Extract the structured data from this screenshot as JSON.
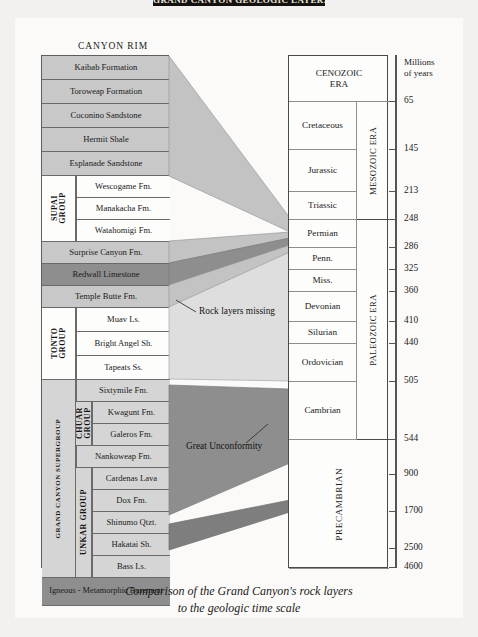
{
  "banner": {
    "text": "GRAND CANYON GEOLOGIC LAYERS"
  },
  "labels": {
    "canyon_rim": "CANYON RIM",
    "rock_layers_missing": "Rock layers missing",
    "great_unconformity": "Great Unconformity",
    "axis_title_line1": "Millions",
    "axis_title_line2": "of years"
  },
  "caption": {
    "line1": "Comparison of the Grand Canyon's rock layers",
    "line2": "to the geologic time scale"
  },
  "colors": {
    "page_background": "#f2f1ef",
    "card_background": "#fbfaf8",
    "strata_medium": "#c8c8c8",
    "strata_dark": "#8e8e8e",
    "strata_white": "#fdfdfc",
    "strata_light": "#d5d5d5",
    "banner": "#15120f",
    "border": "#5e5e5e"
  },
  "strata": {
    "rows": [
      {
        "label": "Kaibab Formation",
        "tone": "g-med",
        "top": 0,
        "height": 24,
        "indent": 0
      },
      {
        "label": "Toroweap Formation",
        "tone": "g-med",
        "top": 24,
        "height": 24,
        "indent": 0
      },
      {
        "label": "Coconino Sandstone",
        "tone": "g-med",
        "top": 48,
        "height": 24,
        "indent": 0
      },
      {
        "label": "Hermit Shale",
        "tone": "g-med",
        "top": 72,
        "height": 24,
        "indent": 0
      },
      {
        "label": "Esplanade Sandstone",
        "tone": "g-med",
        "top": 96,
        "height": 24,
        "indent": 0
      },
      {
        "label": "Wescogame Fm.",
        "tone": "g-white",
        "top": 120,
        "height": 22,
        "indent": 1
      },
      {
        "label": "Manakacha Fm.",
        "tone": "g-white",
        "top": 142,
        "height": 22,
        "indent": 1
      },
      {
        "label": "Watahomigi Fm.",
        "tone": "g-white",
        "top": 164,
        "height": 22,
        "indent": 1
      },
      {
        "label": "Surprise Canyon Fm.",
        "tone": "g-med",
        "top": 186,
        "height": 22,
        "indent": 0
      },
      {
        "label": "Redwall Limestone",
        "tone": "g-dark",
        "top": 208,
        "height": 22,
        "indent": 0
      },
      {
        "label": "Temple Butte Fm.",
        "tone": "g-med",
        "top": 230,
        "height": 22,
        "indent": 0
      },
      {
        "label": "Muav Ls.",
        "tone": "g-white",
        "top": 252,
        "height": 24,
        "indent": 1
      },
      {
        "label": "Bright Angel Sh.",
        "tone": "g-white",
        "top": 276,
        "height": 24,
        "indent": 1
      },
      {
        "label": "Tapeats Ss.",
        "tone": "g-white",
        "top": 300,
        "height": 24,
        "indent": 1
      },
      {
        "label": "Sixtymile Fm.",
        "tone": "g-light",
        "top": 324,
        "height": 22,
        "indent": 1
      },
      {
        "label": "Kwagunt Fm.",
        "tone": "g-light",
        "top": 346,
        "height": 22,
        "indent": 2
      },
      {
        "label": "Galeros Fm.",
        "tone": "g-light",
        "top": 368,
        "height": 22,
        "indent": 2
      },
      {
        "label": "Nankoweap Fm.",
        "tone": "g-light",
        "top": 390,
        "height": 22,
        "indent": 1
      },
      {
        "label": "Cardenas Lava",
        "tone": "g-light",
        "top": 412,
        "height": 22,
        "indent": 2
      },
      {
        "label": "Dox Fm.",
        "tone": "g-light",
        "top": 434,
        "height": 22,
        "indent": 2
      },
      {
        "label": "Shinumo Qtzt.",
        "tone": "g-light",
        "top": 456,
        "height": 22,
        "indent": 2
      },
      {
        "label": "Hakatai Sh.",
        "tone": "g-light",
        "top": 478,
        "height": 22,
        "indent": 2
      },
      {
        "label": "Bass Ls.",
        "tone": "g-light",
        "top": 500,
        "height": 22,
        "indent": 2
      },
      {
        "label": "Igneous - Metamorphic Basement",
        "tone": "g-dark",
        "top": 522,
        "height": 28,
        "indent": 0
      }
    ],
    "groups": [
      {
        "name": "SUPAI GROUP",
        "line1": "SUPAI",
        "line2": "GROUP",
        "top": 120,
        "height": 66,
        "left": 0,
        "width": 34,
        "tone": "g-white",
        "rotated_two_line": true
      },
      {
        "name": "TONTO GROUP",
        "line1": "TONTO",
        "line2": "GROUP",
        "top": 252,
        "height": 72,
        "left": 0,
        "width": 34,
        "tone": "g-white",
        "rotated_two_line": true
      },
      {
        "name": "CHUAR GROUP",
        "line1": "CHUAR",
        "line2": "GROUP",
        "top": 346,
        "height": 44,
        "left": 34,
        "width": 16,
        "tone": "g-light",
        "rotated_two_line": true
      },
      {
        "name": "UNKAR GROUP",
        "line1": "UNKAR GROUP",
        "line2": "",
        "top": 412,
        "height": 110,
        "left": 34,
        "width": 16,
        "tone": "g-light",
        "rotated_two_line": false
      },
      {
        "name": "GRAND CANYON SUPERGROUP",
        "line1": "GRAND CANYON SUPERGROUP",
        "line2": "",
        "top": 324,
        "height": 198,
        "left": 0,
        "width": 34,
        "tone": "g-light",
        "rotated_two_line": false
      }
    ]
  },
  "timescale": {
    "rows": [
      {
        "label": "CENOZOIC ERA",
        "top": 0,
        "height": 46,
        "two_line": true,
        "full_width": true,
        "era": ""
      },
      {
        "label": "Cretaceous",
        "top": 46,
        "height": 48,
        "two_line": false,
        "full_width": false,
        "era": "MESOZOIC ERA"
      },
      {
        "label": "Jurassic",
        "top": 94,
        "height": 42,
        "two_line": false,
        "full_width": false,
        "era": ""
      },
      {
        "label": "Triassic",
        "top": 136,
        "height": 28,
        "two_line": false,
        "full_width": false,
        "era": ""
      },
      {
        "label": "Permian",
        "top": 164,
        "height": 28,
        "two_line": false,
        "full_width": false,
        "era": "PALEOZOIC ERA"
      },
      {
        "label": "Penn.",
        "top": 192,
        "height": 22,
        "two_line": false,
        "full_width": false,
        "era": ""
      },
      {
        "label": "Miss.",
        "top": 214,
        "height": 22,
        "two_line": false,
        "full_width": false,
        "era": ""
      },
      {
        "label": "Devonian",
        "top": 236,
        "height": 30,
        "two_line": false,
        "full_width": false,
        "era": ""
      },
      {
        "label": "Silurian",
        "top": 266,
        "height": 22,
        "two_line": false,
        "full_width": false,
        "era": ""
      },
      {
        "label": "Ordovician",
        "top": 288,
        "height": 38,
        "two_line": false,
        "full_width": false,
        "era": ""
      },
      {
        "label": "Cambrian",
        "top": 326,
        "height": 58,
        "two_line": false,
        "full_width": false,
        "era": ""
      },
      {
        "label": "PRECAMBRIAN",
        "top": 384,
        "height": 129,
        "two_line": false,
        "full_width": true,
        "era": ""
      }
    ],
    "eras": [
      {
        "label": "MESOZOIC ERA",
        "top": 46,
        "height": 118
      },
      {
        "label": "PALEOZOIC ERA",
        "top": 164,
        "height": 220
      }
    ],
    "ticks": [
      {
        "value": "65",
        "top": 46
      },
      {
        "value": "145",
        "top": 94
      },
      {
        "value": "213",
        "top": 136
      },
      {
        "value": "248",
        "top": 164
      },
      {
        "value": "286",
        "top": 192
      },
      {
        "value": "325",
        "top": 214
      },
      {
        "value": "360",
        "top": 236
      },
      {
        "value": "410",
        "top": 266
      },
      {
        "value": "440",
        "top": 288
      },
      {
        "value": "505",
        "top": 326
      },
      {
        "value": "544",
        "top": 384
      },
      {
        "value": "900",
        "top": 419
      },
      {
        "value": "1700",
        "top": 456
      },
      {
        "value": "2500",
        "top": 493
      },
      {
        "value": "4600",
        "top": 512
      }
    ]
  }
}
